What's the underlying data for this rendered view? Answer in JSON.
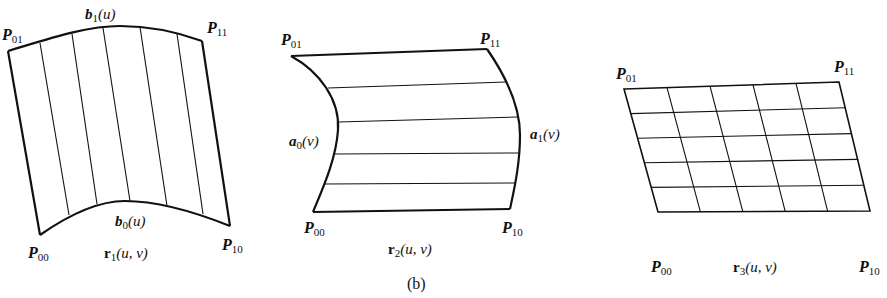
{
  "figure": {
    "caption": "(b)",
    "panels": [
      {
        "id": "r1",
        "surface_label": {
          "name": "r",
          "sub": "1",
          "args": "(u, v)"
        },
        "corners": {
          "P00": {
            "name": "P",
            "sub": "00"
          },
          "P01": {
            "name": "P",
            "sub": "01"
          },
          "P10": {
            "name": "P",
            "sub": "10"
          },
          "P11": {
            "name": "P",
            "sub": "11"
          }
        },
        "curves": {
          "top": {
            "name": "b",
            "sub": "1",
            "args": "(u)"
          },
          "bottom": {
            "name": "b",
            "sub": "0",
            "args": "(u)"
          }
        },
        "rulings": "vertical",
        "ruling_count": 5
      },
      {
        "id": "r2",
        "surface_label": {
          "name": "r",
          "sub": "2",
          "args": "(u, v)"
        },
        "corners": {
          "P00": {
            "name": "P",
            "sub": "00"
          },
          "P01": {
            "name": "P",
            "sub": "01"
          },
          "P10": {
            "name": "P",
            "sub": "10"
          },
          "P11": {
            "name": "P",
            "sub": "11"
          }
        },
        "curves": {
          "left": {
            "name": "a",
            "sub": "0",
            "args": "(v)"
          },
          "right": {
            "name": "a",
            "sub": "1",
            "args": "(v)"
          }
        },
        "rulings": "horizontal",
        "ruling_count": 4
      },
      {
        "id": "r3",
        "surface_label": {
          "name": "r",
          "sub": "3",
          "args": "(u, v)"
        },
        "corners": {
          "P00": {
            "name": "P",
            "sub": "00"
          },
          "P01": {
            "name": "P",
            "sub": "01"
          },
          "P10": {
            "name": "P",
            "sub": "10"
          },
          "P11": {
            "name": "P",
            "sub": "11"
          }
        },
        "grid": {
          "rows": 5,
          "cols": 5
        }
      }
    ]
  }
}
